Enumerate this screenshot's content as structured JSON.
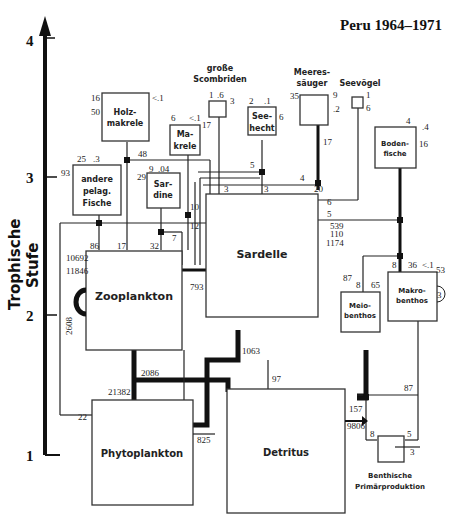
{
  "title": "Peru 1964–1971",
  "axis": {
    "label_line1": "Trophische",
    "label_line2": "Stufe",
    "ticks": [
      "1",
      "2",
      "3",
      "4"
    ]
  },
  "compartments": {
    "holzmakrele": {
      "l1": "Holz-",
      "l2": "makrele",
      "in": "16",
      "out_resp": "50",
      "out_top": "<.1"
    },
    "makrele": {
      "l1": "Ma-",
      "l2": "krele",
      "top1": "6",
      "top2": "<.1",
      "resp": "17"
    },
    "grosse_scombriden": {
      "l1": "große",
      "l2": "Scombriden",
      "top1": "1",
      "top2": ".6",
      "resp": "3"
    },
    "seehecht": {
      "l1": "See-",
      "l2": "hecht",
      "top1": "2",
      "top2": ".1",
      "resp": "6"
    },
    "meeressaeuger": {
      "l1": "Meeres-",
      "l2": "säuger",
      "resp": "35",
      "out1": "9",
      "out2": ".2",
      "in": "17"
    },
    "seevoegel": {
      "l1": "Seevögel",
      "out1": "1",
      "resp": "6"
    },
    "bodenfische": {
      "l1": "Boden-",
      "l2": "fische",
      "top": "4",
      "out1": ".4",
      "resp": "16"
    },
    "andere_pelag": {
      "l1": "andere",
      "l2": "pelag.",
      "l3": "Fische",
      "top1": "25",
      "top2": ".3",
      "resp": "93"
    },
    "sardine": {
      "l1": "Sar-",
      "l2": "dine",
      "top1": "9",
      "top2": ".04",
      "resp": "29"
    },
    "sardelle": {
      "l1": "Sardelle",
      "out1": "539",
      "out2": "110",
      "resp": "1174"
    },
    "zooplankton": {
      "l1": "Zooplankton",
      "out1": "10692",
      "resp": "11846",
      "loop": "2608"
    },
    "meiobenthos": {
      "l1": "Meio-",
      "l2": "benthos",
      "resp": "87",
      "in": "8",
      "out": "65"
    },
    "makrobenthos": {
      "l1": "Makro-",
      "l2": "benthos",
      "in": "8",
      "top1": "36",
      "top2": "<.1",
      "resp": "53",
      "loop": "3"
    },
    "phytoplankton": {
      "l1": "Phytoplankton",
      "out": "825"
    },
    "detritus": {
      "l1": "Detritus",
      "export": "9806"
    },
    "benthische_pp": {
      "l1": "Benthische",
      "l2": "Primärproduktion",
      "in": "8",
      "out": "5",
      "resp": "3"
    }
  },
  "flows": {
    "f48": "48",
    "f5a": "5",
    "f4": "4",
    "f3a": "3",
    "f3b": "3",
    "f20": "20",
    "f6": "6",
    "f5b": "5",
    "f10": "10",
    "f12": "12",
    "f7": "7",
    "f86": "86",
    "f17": "17",
    "f32": "32",
    "f793": "793",
    "f2086": "2086",
    "f21382": "21382",
    "f1063": "1063",
    "f97": "97",
    "f22": "22",
    "f87": "87",
    "f157": "157",
    "f8": "8"
  }
}
